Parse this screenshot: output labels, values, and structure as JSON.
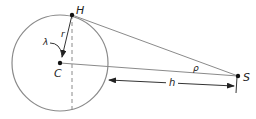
{
  "diagram": {
    "colors": {
      "stroke": "#8a8a8a",
      "ink": "#222222",
      "point": "#111111"
    },
    "points": {
      "H": {
        "label": "H",
        "x": 72,
        "y": 15
      },
      "C": {
        "label": "C",
        "x": 60,
        "y": 63
      },
      "S": {
        "label": "S",
        "x": 238,
        "y": 76
      }
    },
    "circle": {
      "cx": 60,
      "cy": 63,
      "r": 48
    },
    "labels": {
      "r": "r",
      "lambda": "λ",
      "rho": "ρ",
      "h": "h"
    }
  }
}
